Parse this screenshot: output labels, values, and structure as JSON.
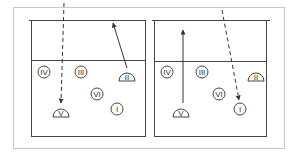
{
  "diagram": {
    "type": "volleyball-rotation",
    "colors": {
      "frame": "#c8c8c8",
      "lines": "#444444",
      "background": "#ffffff"
    },
    "courts": [
      {
        "id": "left",
        "players": [
          {
            "label": "IV",
            "shape": "circle",
            "x": 44,
            "y": 72
          },
          {
            "label": "III",
            "shape": "circle",
            "x": 81,
            "y": 72
          },
          {
            "label": "II",
            "shape": "half-circle",
            "x": 127,
            "y": 77
          },
          {
            "label": "VI",
            "shape": "circle",
            "x": 97,
            "y": 94
          },
          {
            "label": "V",
            "shape": "half-circle",
            "x": 61,
            "y": 113
          },
          {
            "label": "I",
            "shape": "circle",
            "x": 117,
            "y": 109
          }
        ],
        "arrows": [
          {
            "style": "dashed",
            "from": [
              64,
              3
            ],
            "to": [
              61,
              103
            ]
          },
          {
            "style": "solid",
            "from": [
              127,
              68
            ],
            "to": [
              113,
              23
            ]
          }
        ]
      },
      {
        "id": "right",
        "players": [
          {
            "label": "IV",
            "shape": "circle",
            "x": 167,
            "y": 72
          },
          {
            "label": "III",
            "shape": "circle",
            "x": 202,
            "y": 72
          },
          {
            "label": "II",
            "shape": "half-circle",
            "x": 256,
            "y": 77
          },
          {
            "label": "VI",
            "shape": "circle",
            "x": 219,
            "y": 94
          },
          {
            "label": "V",
            "shape": "half-circle",
            "x": 181,
            "y": 113
          },
          {
            "label": "I",
            "shape": "circle",
            "x": 240,
            "y": 109
          }
        ],
        "arrows": [
          {
            "style": "solid",
            "from": [
              183,
              103
            ],
            "to": [
              183,
              30
            ]
          },
          {
            "style": "dashed",
            "from": [
              222,
              10
            ],
            "to": [
              239,
              100
            ]
          }
        ]
      }
    ]
  }
}
